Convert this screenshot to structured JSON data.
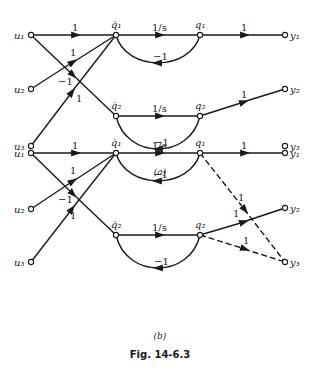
{
  "figure": {
    "title": "Fig. 14-6.3",
    "panels": [
      {
        "caption": "(a)",
        "nodes": {
          "u1": "u₁",
          "u2": "u₂",
          "u3": "u₃",
          "qdot1": "q̇₁",
          "q1": "q₁",
          "qdot2": "q̇₂",
          "q2": "q₂",
          "y1": "y₁",
          "y2": "y₂",
          "y3": "y₃"
        },
        "edges": [
          {
            "from": "u1",
            "to": "qdot1",
            "gain": "1"
          },
          {
            "from": "u2",
            "to": "qdot1",
            "gain": "1"
          },
          {
            "from": "u1",
            "to": "qdot2",
            "gain": "−1"
          },
          {
            "from": "u3",
            "to": "qdot1",
            "gain": "1"
          },
          {
            "from": "qdot1",
            "to": "q1",
            "gain": "1/s"
          },
          {
            "from": "q1",
            "to": "qdot1",
            "gain": "−1"
          },
          {
            "from": "q1",
            "to": "y1",
            "gain": "1"
          },
          {
            "from": "qdot2",
            "to": "q2",
            "gain": "1/s"
          },
          {
            "from": "q2",
            "to": "qdot2",
            "gain": "−1"
          },
          {
            "from": "q2",
            "to": "y2",
            "gain": "1"
          }
        ]
      },
      {
        "caption": "(b)",
        "nodes": {
          "u1": "u₁",
          "u2": "u₂",
          "u3": "u₃",
          "qdot1": "q̇₁",
          "q1": "q₁",
          "qdot2": "q̇₂",
          "q2": "q₂",
          "y1": "y₁",
          "y2": "y₂",
          "y3": "y₃"
        },
        "edges": [
          {
            "from": "u1",
            "to": "qdot1",
            "gain": "1"
          },
          {
            "from": "u2",
            "to": "qdot1",
            "gain": "1"
          },
          {
            "from": "u1",
            "to": "qdot2",
            "gain": "−1"
          },
          {
            "from": "u3",
            "to": "qdot1",
            "gain": "1"
          },
          {
            "from": "qdot1",
            "to": "q1",
            "gain": "1/s"
          },
          {
            "from": "q1",
            "to": "qdot1",
            "gain": "−1"
          },
          {
            "from": "q1",
            "to": "y1",
            "gain": "1"
          },
          {
            "from": "qdot2",
            "to": "q2",
            "gain": "1/s"
          },
          {
            "from": "q2",
            "to": "qdot2",
            "gain": "−1"
          },
          {
            "from": "q2",
            "to": "y2",
            "gain": "1"
          },
          {
            "from": "q1",
            "to": "y3",
            "gain": "1",
            "style": "dashed"
          },
          {
            "from": "q2",
            "to": "y3",
            "gain": "1",
            "style": "dashed"
          }
        ]
      }
    ]
  }
}
